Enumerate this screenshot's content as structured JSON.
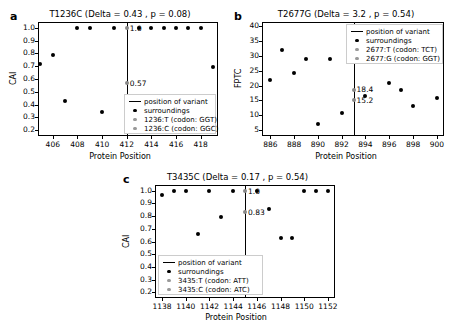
{
  "figure": {
    "panels": [
      {
        "letter": "a",
        "title": "T1236C (Delta = 0.43 , p = 0.08)",
        "xlabel": "Protein Position",
        "ylabel": "CAI",
        "annotations": [
          "1.0",
          "0.57"
        ],
        "legend": {
          "line_label": "position of variant",
          "surroundings_label": "surroundings",
          "ref_label": "1236:T (codon: GGT)",
          "alt_label": "1236:C (codon: GGC)"
        }
      },
      {
        "letter": "b",
        "title": "T2677G (Delta = 3.2 , p = 0.54)",
        "xlabel": "Protein Position",
        "ylabel": "FPTC",
        "annotations": [
          "18.4",
          "15.2"
        ],
        "legend": {
          "line_label": "position of variant",
          "surroundings_label": "surroundings",
          "ref_label": "2677:T (codon: TCT)",
          "alt_label": "2677:G (codon: GGT)"
        }
      },
      {
        "letter": "c",
        "title": "T3435C (Delta = 0.17 , p = 0.54)",
        "xlabel": "Protein Position",
        "ylabel": "CAI",
        "annotations": [
          "1.0",
          "0.83"
        ],
        "legend": {
          "line_label": "position of variant",
          "surroundings_label": "surroundings",
          "ref_label": "3435:T (codon: ATT)",
          "alt_label": "3435:C (codon: ATC)"
        }
      }
    ]
  },
  "chart_data": [
    {
      "type": "scatter",
      "panel": "a",
      "title": "T1236C (Delta = 0.43 , p = 0.08)",
      "xlabel": "Protein Position",
      "ylabel": "CAI",
      "xlim": [
        404.8,
        419.4
      ],
      "ylim": [
        0.155,
        1.045
      ],
      "xticks": [
        406,
        408,
        410,
        412,
        414,
        416,
        418
      ],
      "yticks": [
        0.2,
        0.3,
        0.4,
        0.5,
        0.6,
        0.7,
        0.8,
        0.9,
        1.0
      ],
      "grid": false,
      "variant_position": 412,
      "variant_values": {
        "ref": 0.57,
        "alt": 1.0
      },
      "series": [
        {
          "name": "surroundings",
          "x": [
            405,
            406,
            407,
            408,
            409,
            410,
            411,
            413,
            414,
            415,
            416,
            417,
            418,
            419
          ],
          "y": [
            0.72,
            0.79,
            0.43,
            1.0,
            1.0,
            0.345,
            1.0,
            1.0,
            1.0,
            1.0,
            1.0,
            1.0,
            1.0,
            0.69
          ]
        }
      ],
      "legend_entries": [
        "position of variant",
        "surroundings",
        "1236:T (codon: GGT)",
        "1236:C (codon: GGC)"
      ],
      "legend_position": "lower right"
    },
    {
      "type": "scatter",
      "panel": "b",
      "title": "T2677G (Delta = 3.2 , p = 0.54)",
      "xlabel": "Protein Position",
      "ylabel": "FPTC",
      "xlim": [
        885.3,
        900.6
      ],
      "ylim": [
        3.0,
        41.5
      ],
      "xticks": [
        886,
        888,
        890,
        892,
        894,
        896,
        898,
        900
      ],
      "yticks": [
        5,
        10,
        15,
        20,
        25,
        30,
        35,
        40
      ],
      "grid": false,
      "variant_position": 893,
      "variant_values": {
        "ref": 18.4,
        "alt": 15.2
      },
      "series": [
        {
          "name": "surroundings",
          "x": [
            886,
            887,
            888,
            889,
            890,
            891,
            892,
            894,
            896,
            897,
            898,
            900
          ],
          "y": [
            22.0,
            32.0,
            24.4,
            29.0,
            7.2,
            29.0,
            10.9,
            16.5,
            21.0,
            18.5,
            13.2,
            16.0
          ]
        }
      ],
      "legend_entries": [
        "position of variant",
        "surroundings",
        "2677:T (codon: TCT)",
        "2677:G (codon: GGT)"
      ],
      "legend_position": "upper right"
    },
    {
      "type": "scatter",
      "panel": "c",
      "title": "T3435C (Delta = 0.17 , p = 0.54)",
      "xlabel": "Protein Position",
      "ylabel": "CAI",
      "xlim": [
        1137.4,
        1152.6
      ],
      "ylim": [
        0.155,
        1.045
      ],
      "xticks": [
        1138,
        1140,
        1142,
        1144,
        1146,
        1148,
        1150,
        1152
      ],
      "yticks": [
        0.2,
        0.3,
        0.4,
        0.5,
        0.6,
        0.7,
        0.8,
        0.9,
        1.0
      ],
      "grid": false,
      "variant_position": 1145,
      "variant_values": {
        "ref": 1.0,
        "alt": 0.83
      },
      "series": [
        {
          "name": "surroundings",
          "x": [
            1138,
            1139,
            1140,
            1141,
            1142,
            1143,
            1144,
            1146,
            1147,
            1148,
            1149,
            1150,
            1151,
            1152
          ],
          "y": [
            0.97,
            1.0,
            1.0,
            0.66,
            1.0,
            0.79,
            1.0,
            1.0,
            0.855,
            0.63,
            0.63,
            1.0,
            1.0,
            1.0
          ]
        }
      ],
      "legend_entries": [
        "position of variant",
        "surroundings",
        "3435:T (codon: ATT)",
        "3435:C (codon: ATC)"
      ],
      "legend_position": "lower left"
    }
  ]
}
